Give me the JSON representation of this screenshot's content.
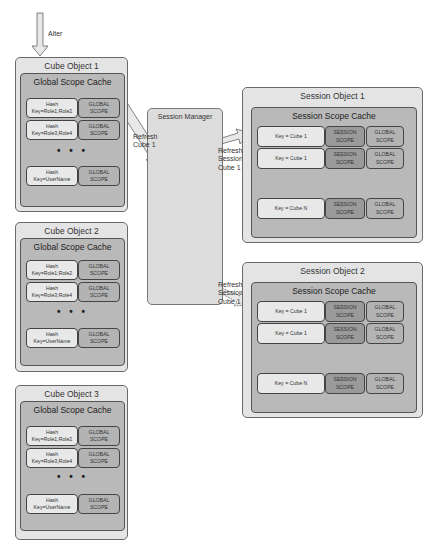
{
  "top_arrow": {
    "label": "Alter"
  },
  "cube_objects": [
    {
      "title": "Cube Object 1",
      "cache_title": "Global Scope Cache",
      "rows": [
        {
          "key": "Hash\nKey=Role1;Role2",
          "scope": "GLOBAL\nSCOPE"
        },
        {
          "key": "Hash\nKey=Role3;Role4",
          "scope": "GLOBAL\nSCOPE"
        },
        {
          "key": "Hash\nKey=UserName",
          "scope": "GLOBAL\nSCOPE"
        }
      ],
      "ellipsis": "• • •"
    },
    {
      "title": "Cube Object 2",
      "cache_title": "Global Scope Cache",
      "rows": [
        {
          "key": "Hash\nKey=Role1;Role2",
          "scope": "GLOBAL\nSCOPE"
        },
        {
          "key": "Hash\nKey=Role3;Role4",
          "scope": "GLOBAL\nSCOPE"
        },
        {
          "key": "Hash\nKey=UserName",
          "scope": "GLOBAL\nSCOPE"
        }
      ],
      "ellipsis": "• • •"
    },
    {
      "title": "Cube Object 3",
      "cache_title": "Global Scope Cache",
      "rows": [
        {
          "key": "Hash\nKey=Role1;Role2",
          "scope": "GLOBAL\nSCOPE"
        },
        {
          "key": "Hash\nKey=Role3;Role4",
          "scope": "GLOBAL\nSCOPE"
        },
        {
          "key": "Hash\nKey=UserName",
          "scope": "GLOBAL\nSCOPE"
        }
      ],
      "ellipsis": "• • •"
    }
  ],
  "session_manager": {
    "title": "Session Manager"
  },
  "arrows": {
    "refresh_cube": "Refresh\nCube 1",
    "refresh_session_1": "Refresh\nSession\nCube 1",
    "refresh_session_2": "Refresh\nSession\nCube 1"
  },
  "session_objects": [
    {
      "title": "Session Object 1",
      "cache_title": "Session Scope Cache",
      "rows": [
        {
          "key": "Key = Cube 1",
          "session": "SESSION\nSCOPE",
          "global": "GLOBAL\nSCOPE"
        },
        {
          "key": "Key = Cube 1",
          "session": "SESSION\nSCOPE",
          "global": "GLOBAL\nSCOPE"
        },
        {
          "key": "Key = Cube N",
          "session": "SESSION\nSCOPE",
          "global": "GLOBAL\nSCOPE"
        }
      ]
    },
    {
      "title": "Session Object 2",
      "cache_title": "Session Scope Cache",
      "rows": [
        {
          "key": "Key = Cube 1",
          "session": "SESSION\nSCOPE",
          "global": "GLOBAL\nSCOPE"
        },
        {
          "key": "Key = Cube 1",
          "session": "SESSION\nSCOPE",
          "global": "GLOBAL\nSCOPE"
        },
        {
          "key": "Key = Cube N",
          "session": "SESSION\nSCOPE",
          "global": "GLOBAL\nSCOPE"
        }
      ]
    }
  ],
  "colors": {
    "outer_fill": "#e4e4e4",
    "inner_fill": "#b9b9b9",
    "key_cell": "#e8e8e8",
    "global_cell": "#b3b3b3",
    "session_cell": "#9a9a9a",
    "session_manager_fill": "#dcdcdc"
  }
}
